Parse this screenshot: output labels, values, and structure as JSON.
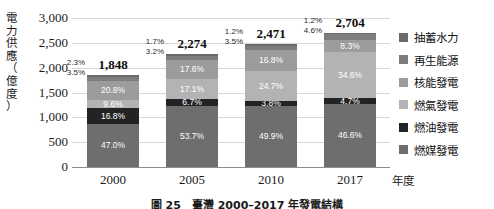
{
  "axis": {
    "y_title": [
      "電",
      "力",
      "供",
      "應",
      "（",
      "億",
      "度",
      "）"
    ],
    "y_ticks": [
      "3,000",
      "2,500",
      "2,000",
      "1,500",
      "1,000",
      "500",
      "0"
    ],
    "x_unit": "年度"
  },
  "legend": {
    "items": [
      {
        "label": "抽蓄水力",
        "color": "#6b6b6b"
      },
      {
        "label": "再生能源",
        "color": "#7d7d7d"
      },
      {
        "label": "核能發電",
        "color": "#9c9c9c"
      },
      {
        "label": "燃氣發電",
        "color": "#b3b3b3"
      },
      {
        "label": "燃油發電",
        "color": "#232323"
      },
      {
        "label": "燃媒發電",
        "color": "#6e6e6e"
      }
    ]
  },
  "caption": {
    "text": "圖 25　臺灣 2000–2017 年發電結構"
  },
  "chart_data": {
    "type": "bar",
    "subtype": "stacked-percent-with-totals",
    "title": "",
    "xlabel": "年度",
    "ylabel": "電力供應（億度）",
    "ylim": [
      0,
      3000
    ],
    "ytick_step": 500,
    "grid": true,
    "legend_position": "right",
    "categories": [
      "2000",
      "2005",
      "2010",
      "2017"
    ],
    "totals": [
      1848,
      2274,
      2471,
      2704
    ],
    "total_labels": [
      "1,848",
      "2,274",
      "2,471",
      "2,704"
    ],
    "series": [
      {
        "name": "燃媒發電",
        "color": "#6e6e6e",
        "values": [
          47.0,
          53.7,
          49.9,
          46.6
        ],
        "labels": [
          "47.0%",
          "53.7%",
          "49.9%",
          "46.6%"
        ],
        "label_inside": true
      },
      {
        "name": "燃油發電",
        "color": "#232323",
        "values": [
          16.8,
          6.7,
          3.8,
          4.7
        ],
        "labels": [
          "16.8%",
          "6.7%",
          "3.8%",
          "4.7%"
        ],
        "label_inside": true
      },
      {
        "name": "燃氣發電",
        "color": "#b3b3b3",
        "values": [
          9.6,
          17.1,
          24.7,
          34.6
        ],
        "labels": [
          "9.6%",
          "17.1%",
          "24.7%",
          "34.6%"
        ],
        "label_inside": true
      },
      {
        "name": "核能發電",
        "color": "#9c9c9c",
        "values": [
          20.8,
          17.6,
          16.8,
          8.3
        ],
        "labels": [
          "20.8%",
          "17.6%",
          "16.8%",
          "8.3%"
        ],
        "label_inside": true
      },
      {
        "name": "再生能源",
        "color": "#7d7d7d",
        "values": [
          3.5,
          3.2,
          3.5,
          4.6
        ],
        "labels": [
          "3.5%",
          "3.2%",
          "3.5%",
          "4.6%"
        ],
        "label_inside": false
      },
      {
        "name": "抽蓄水力",
        "color": "#6b6b6b",
        "values": [
          2.3,
          1.7,
          1.2,
          1.2
        ],
        "labels": [
          "2.3%",
          "1.7%",
          "1.2%",
          "1.2%"
        ],
        "label_inside": false
      }
    ]
  }
}
